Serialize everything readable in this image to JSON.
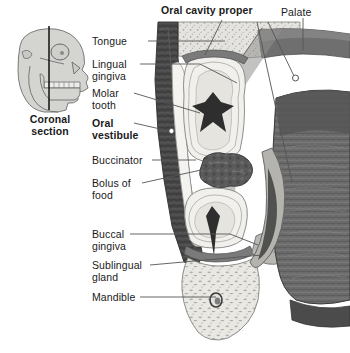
{
  "figure": {
    "kind": "anatomical-illustration",
    "palette": {
      "background": "#ffffff",
      "bone_stipple": "#dcdcd8",
      "bone_outline": "#8d8d8a",
      "tooth_light": "#f2f1ee",
      "tooth_mid": "#e2e0db",
      "pulp_dark": "#2f2f2f",
      "mucosa_dark": "#3c3c3c",
      "muscle_mid": "#6f6f6f",
      "muscle_dark": "#4a4a4a",
      "bolus": "#555555",
      "inset_fill": "#d3d3d0",
      "inset_line": "#6e6e6e",
      "leader_line": "#555555",
      "text": "#1a1a1a"
    }
  },
  "inset": {
    "name": "lateral-skull-view",
    "caption": "Coronal\nsection",
    "caption_bold": true
  },
  "labels": [
    {
      "id": "oral-cavity-proper",
      "text": "Oral cavity proper",
      "bold": true,
      "x": 161,
      "y": 5,
      "align": "left"
    },
    {
      "id": "palate",
      "text": "Palate",
      "bold": false,
      "x": 281,
      "y": 7,
      "align": "left"
    },
    {
      "id": "tongue",
      "text": "Tongue",
      "bold": false,
      "x": 92,
      "y": 36,
      "align": "left"
    },
    {
      "id": "lingual-gingiva",
      "text": "Lingual\ngingiva",
      "bold": false,
      "x": 92,
      "y": 59,
      "align": "left"
    },
    {
      "id": "molar-tooth",
      "text": "Molar\ntooth",
      "bold": false,
      "x": 92,
      "y": 88,
      "align": "left"
    },
    {
      "id": "oral-vestibule",
      "text": "Oral\nvestibule",
      "bold": true,
      "x": 92,
      "y": 118,
      "align": "left"
    },
    {
      "id": "buccinator",
      "text": "Buccinator",
      "bold": false,
      "x": 92,
      "y": 155,
      "align": "left"
    },
    {
      "id": "bolus-of-food",
      "text": "Bolus of\nfood",
      "bold": false,
      "x": 92,
      "y": 178,
      "align": "left"
    },
    {
      "id": "buccal-gingiva",
      "text": "Buccal\ngingiva",
      "bold": false,
      "x": 92,
      "y": 229,
      "align": "left"
    },
    {
      "id": "sublingual-gland",
      "text": "Sublingual\ngland",
      "bold": false,
      "x": 92,
      "y": 260,
      "align": "left"
    },
    {
      "id": "mandible",
      "text": "Mandible",
      "bold": false,
      "x": 92,
      "y": 292,
      "align": "left"
    },
    {
      "id": "coronal-section",
      "text": "Coronal\nsection",
      "bold": true,
      "x": 14,
      "y": 114,
      "align": "center"
    }
  ],
  "leaders": [
    {
      "for": "tongue",
      "points": "148,41 225,41",
      "marker": null
    },
    {
      "for": "lingual-gingiva",
      "points": "140,64 200,64 237,83",
      "marker": null
    },
    {
      "for": "molar-tooth",
      "points": "134,93 200,113",
      "marker": null
    },
    {
      "for": "oral-vestibule",
      "points": "134,123 170,131",
      "marker": "172,131"
    },
    {
      "for": "buccinator",
      "points": "152,160 196,160",
      "marker": null
    },
    {
      "for": "bolus-of-food",
      "points": "142,183 210,168",
      "marker": null
    },
    {
      "for": "buccal-gingiva",
      "points": "130,234 230,234 258,245",
      "marker": null
    },
    {
      "for": "sublingual-gland",
      "points": "150,265 262,255",
      "marker": null
    },
    {
      "for": "mandible",
      "points": "140,297 216,297",
      "marker": null
    },
    {
      "for": "oral-cavity-proper",
      "points": "222,20 205,55",
      "marker": null
    },
    {
      "for": "palate",
      "points": "303,18 303,50",
      "marker": null
    },
    {
      "for": "palate-hook",
      "points": "268,22 296,78",
      "marker": "296,78"
    },
    {
      "for": "tongue-right",
      "points": "257,22 292,180",
      "marker": null
    }
  ]
}
